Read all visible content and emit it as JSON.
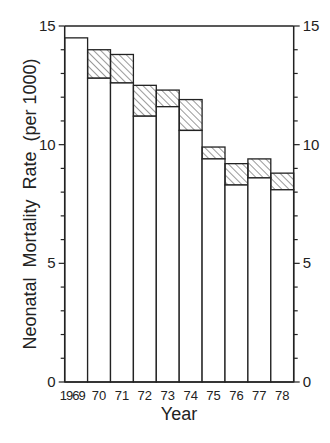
{
  "chart_data": {
    "type": "bar",
    "subtype": "stacked-with-hatched-band",
    "title": "",
    "xlabel": "Year",
    "ylabel": "Neonatal  Mortality  Rate  (per 1000)",
    "categories": [
      "1969",
      "70",
      "71",
      "72",
      "73",
      "74",
      "75",
      "76",
      "77",
      "78"
    ],
    "series": [
      {
        "name": "lower (white)",
        "values": [
          14.5,
          12.8,
          12.6,
          11.2,
          11.6,
          10.6,
          9.4,
          8.3,
          8.6,
          8.1
        ]
      },
      {
        "name": "upper (hatched)",
        "values": [
          14.5,
          14.0,
          13.8,
          12.5,
          12.3,
          11.9,
          9.9,
          9.2,
          9.4,
          8.8
        ]
      }
    ],
    "ylim": [
      0,
      15
    ],
    "yticks_major": [
      0,
      5,
      10,
      15
    ],
    "yticks_minor_step": 1,
    "y_axis_both_sides": true,
    "grid": false,
    "legend": null,
    "colors": {
      "bar_fill": "#ffffff",
      "bar_stroke": "#222222",
      "hatch": "#555555"
    }
  },
  "labels": {
    "xlabel": "Year",
    "ylabel": "Neonatal  Mortality  Rate  (per 1000)"
  }
}
